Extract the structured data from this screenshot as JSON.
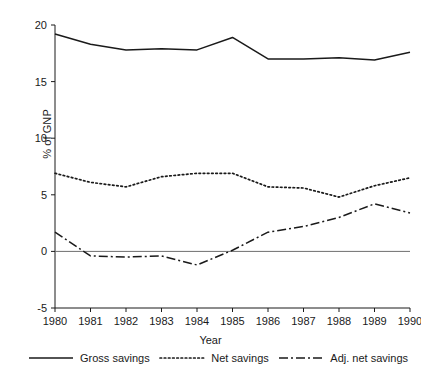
{
  "chart_data": {
    "type": "line",
    "title": "",
    "xlabel": "Year",
    "ylabel": "% of GNP",
    "x": [
      1980,
      1981,
      1982,
      1983,
      1984,
      1985,
      1986,
      1987,
      1988,
      1989,
      1990
    ],
    "categories": [
      "1980",
      "1981",
      "1982",
      "1983",
      "1984",
      "1985",
      "1986",
      "1987",
      "1988",
      "1989",
      "1990"
    ],
    "xlim": [
      1980,
      1990
    ],
    "ylim": [
      -5,
      20
    ],
    "yticks": [
      -5,
      0,
      5,
      10,
      15,
      20
    ],
    "ytick_labels": [
      "-5",
      "0",
      "5",
      "10",
      "15",
      "20"
    ],
    "grid": false,
    "legend_position": "bottom",
    "zero_line": true,
    "series": [
      {
        "name": "Gross savings",
        "style": "solid",
        "color": "#1a1a1a",
        "values": [
          19.2,
          18.3,
          17.8,
          17.9,
          17.8,
          18.9,
          17.0,
          17.0,
          17.1,
          16.9,
          17.6
        ]
      },
      {
        "name": "Net savings",
        "style": "dotted",
        "color": "#1a1a1a",
        "values": [
          6.9,
          6.1,
          5.7,
          6.6,
          6.9,
          6.9,
          5.7,
          5.6,
          4.8,
          5.8,
          6.5
        ]
      },
      {
        "name": "Adj. net savings",
        "style": "dashdot",
        "color": "#1a1a1a",
        "values": [
          1.7,
          -0.4,
          -0.5,
          -0.4,
          -1.2,
          0.1,
          1.7,
          2.2,
          3.0,
          4.2,
          3.4
        ]
      }
    ]
  },
  "legend": {
    "items": [
      {
        "label": "Gross savings",
        "style": "solid"
      },
      {
        "label": "Net savings",
        "style": "dotted"
      },
      {
        "label": "Adj. net savings",
        "style": "dashdot"
      }
    ]
  },
  "axes": {
    "x_title": "Year",
    "y_title": "% of GNP"
  }
}
